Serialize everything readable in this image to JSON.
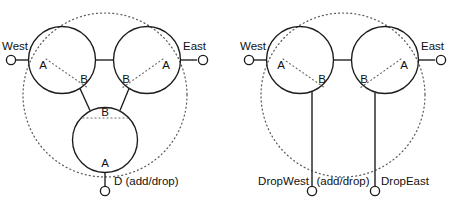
{
  "figure": {
    "colors": {
      "line": "#1c1c1c",
      "dotted_ring": "#5a5a5a",
      "background": "#ffffff"
    }
  },
  "diagrams": [
    {
      "id": "three-node-ring",
      "name": "three-node-ring-diagram",
      "nodes": [
        {
          "id": "west-node",
          "label": "A",
          "sublabel": "B"
        },
        {
          "id": "east-node",
          "label": "A",
          "sublabel": "B"
        },
        {
          "id": "drop-node",
          "label": "A",
          "sublabel": "B"
        }
      ],
      "ports": [
        {
          "id": "west-port",
          "label": "West"
        },
        {
          "id": "east-port",
          "label": "East"
        },
        {
          "id": "drop-port",
          "label": "D (add/drop)"
        }
      ]
    },
    {
      "id": "two-node-ring",
      "name": "two-node-ring-diagram",
      "nodes": [
        {
          "id": "west-node",
          "label": "A",
          "sublabel": "B"
        },
        {
          "id": "east-node",
          "label": "A",
          "sublabel": "B"
        }
      ],
      "ports": [
        {
          "id": "west-port",
          "label": "West"
        },
        {
          "id": "east-port",
          "label": "East"
        },
        {
          "id": "dropwest-port",
          "label": "DropWest"
        },
        {
          "id": "dropeast-port",
          "label": "DropEast"
        },
        {
          "id": "adddrop-note",
          "label": "(add/drop)"
        }
      ]
    }
  ],
  "labels": {
    "left": {
      "west": "West",
      "east": "East",
      "node_a_west": "A",
      "node_b_west": "B",
      "node_a_east": "A",
      "node_b_east": "B",
      "node_b_drop": "B",
      "node_a_drop": "A",
      "drop": "D (add/drop)"
    },
    "right": {
      "west": "West",
      "east": "East",
      "node_a_west": "A",
      "node_b_west": "B",
      "node_a_east": "A",
      "node_b_east": "B",
      "dropwest": "DropWest",
      "adddrop": "(add/drop)",
      "dropeast": "DropEast"
    }
  }
}
